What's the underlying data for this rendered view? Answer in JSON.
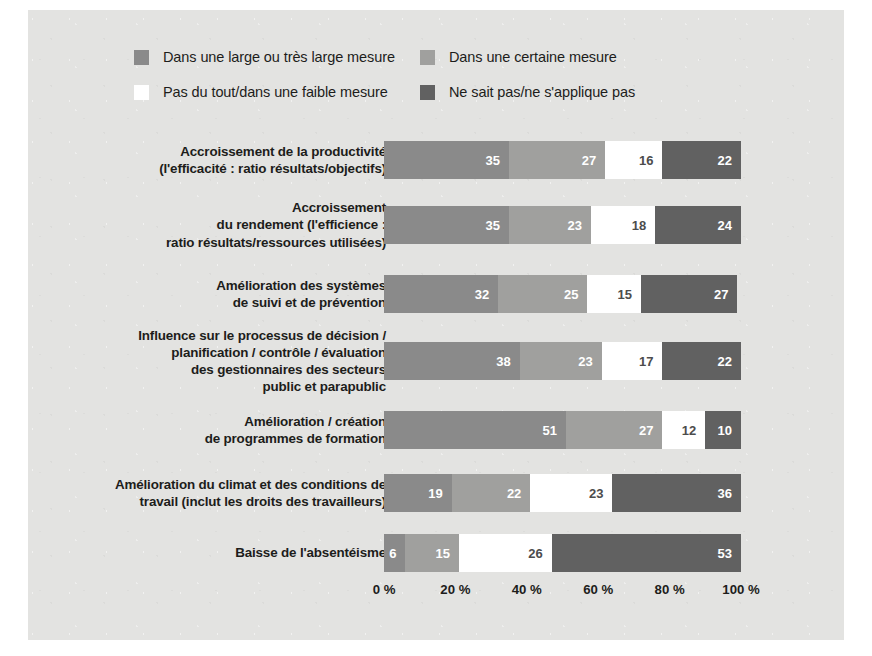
{
  "figure": {
    "background_color": "#e3e3e1",
    "page_background": "#ffffff"
  },
  "legend": {
    "items": [
      {
        "label": "Dans une large ou très large mesure",
        "color": "#8a8a8a",
        "column": 1,
        "row": 1
      },
      {
        "label": "Dans une certaine mesure",
        "color": "#a0a09e",
        "column": 2,
        "row": 1
      },
      {
        "label": "Pas du tout/dans une faible mesure",
        "color": "#ffffff",
        "column": 1,
        "row": 2
      },
      {
        "label": "Ne sait pas/ne s'applique pas",
        "color": "#616161",
        "column": 2,
        "row": 2
      }
    ]
  },
  "axis": {
    "ticks": [
      "0 %",
      "20 %",
      "40 %",
      "60 %",
      "80 %",
      "100 %"
    ],
    "values": [
      0,
      20,
      40,
      60,
      80,
      100
    ]
  },
  "chart_data": {
    "type": "bar",
    "orientation": "horizontal",
    "stacked": true,
    "stack_mode": "percent",
    "title": "",
    "xlabel": "",
    "ylabel": "",
    "xlim": [
      0,
      100
    ],
    "grid": false,
    "legend_position": "top",
    "categories": [
      "Accroissement de la productivité (l'efficacité : ratio résultats/objectifs)",
      "Accroissement du rendement (l'efficience : ratio résultats/ressources utilisées)",
      "Amélioration des systèmes de suivi et de prévention",
      "Influence sur le processus de décision / planification / contrôle / évaluation des gestionnaires des secteurs public et parapublic",
      "Amélioration / création de programmes de formation",
      "Amélioration du climat et des conditions de travail (inclut les droits des travailleurs)",
      "Baisse de l'absentéisme"
    ],
    "category_lines": [
      [
        "Accroissement de la productivité",
        "(l'efficacité : ratio résultats/objectifs)"
      ],
      [
        "Accroissement",
        "du rendement (l'efficience :",
        "ratio résultats/ressources utilisées)"
      ],
      [
        "Amélioration des systèmes",
        "de suivi et de prévention"
      ],
      [
        "Influence sur le processus de décision /",
        "planification / contrôle / évaluation",
        "des gestionnaires des secteurs",
        "public et parapublic"
      ],
      [
        "Amélioration / création",
        "de programmes de formation"
      ],
      [
        "Amélioration du climat et des conditions de",
        "travail (inclut les droits des travailleurs)"
      ],
      [
        "Baisse de l'absentéisme"
      ]
    ],
    "series": [
      {
        "name": "Dans une large ou très large mesure",
        "color": "#8a8a8a",
        "values": [
          35,
          35,
          32,
          38,
          51,
          19,
          6
        ]
      },
      {
        "name": "Dans une certaine mesure",
        "color": "#a0a09e",
        "values": [
          27,
          23,
          25,
          23,
          27,
          22,
          15
        ]
      },
      {
        "name": "Pas du tout/dans une faible mesure",
        "color": "#ffffff",
        "values": [
          16,
          18,
          15,
          17,
          12,
          23,
          26
        ]
      },
      {
        "name": "Ne sait pas/ne s'applique pas",
        "color": "#616161",
        "values": [
          22,
          24,
          27,
          22,
          10,
          36,
          53
        ]
      }
    ]
  }
}
